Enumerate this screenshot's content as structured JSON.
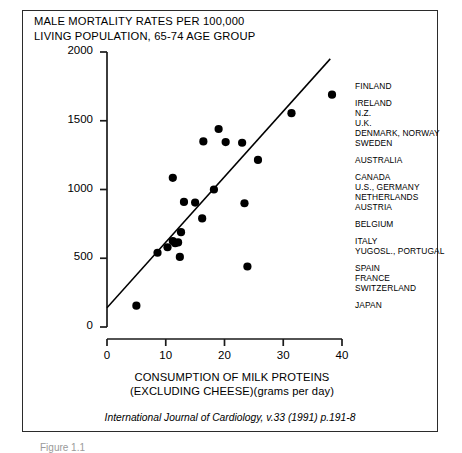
{
  "figure": {
    "title_line1": "MALE MORTALITY RATES PER 100,000",
    "title_line2": "LIVING POPULATION, 65-74 AGE GROUP",
    "xaxis_title_line1": "CONSUMPTION OF MILK PROTEINS",
    "xaxis_title_line2": "(EXCLUDING CHEESE)(grams per day)",
    "citation": "International Journal of Cardiology, v.33 (1991) p.191-8",
    "caption_partial": "Figure 1.1",
    "line_color": "#000000",
    "point_color": "#000000",
    "border_color": "#2b2b2b"
  },
  "chart_data": {
    "type": "scatter",
    "title": "MALE MORTALITY RATES PER 100,000 LIVING POPULATION, 65-74 AGE GROUP",
    "xlabel": "CONSUMPTION OF MILK PROTEINS (EXCLUDING CHEESE)(grams per day)",
    "ylabel": "",
    "xlim": [
      0,
      40
    ],
    "ylim": [
      0,
      2000
    ],
    "xticks": [
      0,
      10,
      20,
      30,
      40
    ],
    "yticks": [
      0,
      500,
      1000,
      1500,
      2000
    ],
    "xtick_labels": [
      "0",
      "10",
      "20",
      "30",
      "40"
    ],
    "ytick_labels": [
      "0",
      "500",
      "1000",
      "1500",
      "2000"
    ],
    "grid": false,
    "legend": "none",
    "points": [
      {
        "x": 38.3,
        "y": 1690,
        "label": "FINLAND"
      },
      {
        "x": 31.4,
        "y": 1555,
        "label": "IRELAND"
      },
      {
        "x": 19.0,
        "y": 1440,
        "label": "N.Z."
      },
      {
        "x": 16.4,
        "y": 1350,
        "label": "U.K."
      },
      {
        "x": 20.2,
        "y": 1345,
        "label": "DENMARK"
      },
      {
        "x": 23.0,
        "y": 1340,
        "label": "NORWAY"
      },
      {
        "x": 25.7,
        "y": 1215,
        "label": "SWEDEN"
      },
      {
        "x": 11.2,
        "y": 1085,
        "label": "AUSTRALIA"
      },
      {
        "x": 18.2,
        "y": 1000,
        "label": "CANADA"
      },
      {
        "x": 13.1,
        "y": 910,
        "label": "U.S."
      },
      {
        "x": 15.0,
        "y": 905,
        "label": "GERMANY"
      },
      {
        "x": 23.4,
        "y": 900,
        "label": "NETHERLANDS"
      },
      {
        "x": 16.2,
        "y": 790,
        "label": "AUSTRIA"
      },
      {
        "x": 12.6,
        "y": 690,
        "label": "BELGIUM"
      },
      {
        "x": 10.3,
        "y": 580,
        "label": "ITALY"
      },
      {
        "x": 11.2,
        "y": 625,
        "label": "YUGOSL."
      },
      {
        "x": 11.6,
        "y": 610,
        "label": "PORTUGAL"
      },
      {
        "x": 12.1,
        "y": 615,
        "label": "SPAIN"
      },
      {
        "x": 8.6,
        "y": 540,
        "label": "FRANCE"
      },
      {
        "x": 12.4,
        "y": 510,
        "label": "SWITZERLAND"
      },
      {
        "x": 23.9,
        "y": 440,
        "label": "JAPAN"
      },
      {
        "x": 5.0,
        "y": 155,
        "label": ""
      }
    ],
    "trend_line": {
      "x0": 0,
      "y0": 140,
      "x1": 38.0,
      "y1": 1950
    }
  },
  "legend_groups": [
    {
      "rows": [
        "FINLAND"
      ]
    },
    {
      "rows": [
        "IRELAND",
        "N.Z.",
        "U.K.",
        "DENMARK, NORWAY",
        "SWEDEN"
      ]
    },
    {
      "rows": [
        "AUSTRALIA"
      ]
    },
    {
      "rows": [
        "CANADA",
        "U.S., GERMANY",
        "NETHERLANDS",
        "AUSTRIA"
      ]
    },
    {
      "rows": [
        "BELGIUM"
      ]
    },
    {
      "rows": [
        "ITALY",
        "YUGOSL., PORTUGAL"
      ]
    },
    {
      "rows": [
        "SPAIN",
        "FRANCE",
        "SWITZERLAND"
      ]
    },
    {
      "rows": [
        "JAPAN"
      ]
    }
  ]
}
